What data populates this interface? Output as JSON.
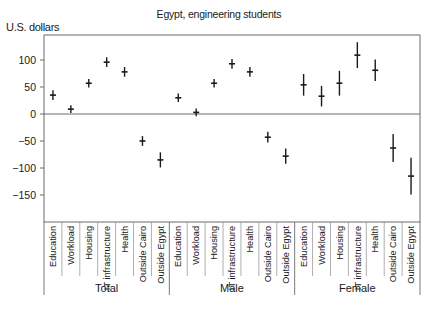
{
  "chart_data": {
    "type": "scatter",
    "subtype": "point-with-error-bars",
    "title": "Egypt, engineering students",
    "xlabel": "",
    "ylabel": "U.S. dollars",
    "ylim": [
      -200,
      146
    ],
    "yticks": [
      100,
      50,
      0,
      -50,
      -100,
      -150
    ],
    "ytick_labels": [
      "100",
      "50",
      "0",
      "−50",
      "−100",
      "−150"
    ],
    "grid": false,
    "zero_line": true,
    "legend": null,
    "categories": [
      "Education",
      "Workload",
      "Housing",
      "IT infrastructure",
      "Health",
      "Outside Cairo",
      "Outside Egypt"
    ],
    "groups": [
      "Total",
      "Male",
      "Female"
    ],
    "series": [
      {
        "name": "Total",
        "values": [
          35,
          9,
          57,
          96,
          78,
          -50,
          -85
        ],
        "error": [
          9,
          7,
          8,
          9,
          9,
          9,
          14
        ]
      },
      {
        "name": "Male",
        "values": [
          30,
          3,
          57,
          93,
          78,
          -43,
          -78
        ],
        "error": [
          8,
          7,
          8,
          9,
          9,
          10,
          14
        ]
      },
      {
        "name": "Female",
        "values": [
          54,
          33,
          57,
          109,
          81,
          -63,
          -115
        ],
        "error": [
          20,
          19,
          23,
          24,
          20,
          26,
          34
        ]
      }
    ]
  },
  "colors": {
    "marker": "#1a1a1a",
    "axis": "#6b6b6b",
    "zero_line": "#6b6b6b"
  }
}
